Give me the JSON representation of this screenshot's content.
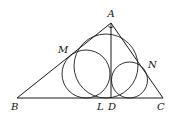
{
  "figure": {
    "type": "geometry",
    "colors": {
      "stroke": "#1a1a1a",
      "background": "#ffffff"
    },
    "points": {
      "A": {
        "label": "A",
        "x": 111,
        "y": 23
      },
      "B": {
        "label": "B",
        "x": 17,
        "y": 98
      },
      "C": {
        "label": "C",
        "x": 163,
        "y": 98
      },
      "D": {
        "label": "D",
        "x": 111,
        "y": 98
      },
      "L": {
        "label": "L",
        "x": 102,
        "y": 98
      },
      "M": {
        "label": "M",
        "x": 77,
        "y": 50
      },
      "N": {
        "label": "N",
        "x": 145,
        "y": 62
      }
    },
    "segments": [
      [
        "A",
        "B"
      ],
      [
        "A",
        "C"
      ],
      [
        "B",
        "C"
      ],
      [
        "A",
        "D"
      ]
    ],
    "circles": [
      {
        "name": "incircle-ABC",
        "cx": 106,
        "cy": 66,
        "r": 32
      },
      {
        "name": "incircle-ABD",
        "cx": 86,
        "cy": 74,
        "r": 24
      },
      {
        "name": "incircle-ADC",
        "cx": 129.5,
        "cy": 80,
        "r": 18
      }
    ],
    "labels": {
      "A": "A",
      "B": "B",
      "C": "C",
      "D": "D",
      "L": "L",
      "M": "M",
      "N": "N"
    }
  }
}
